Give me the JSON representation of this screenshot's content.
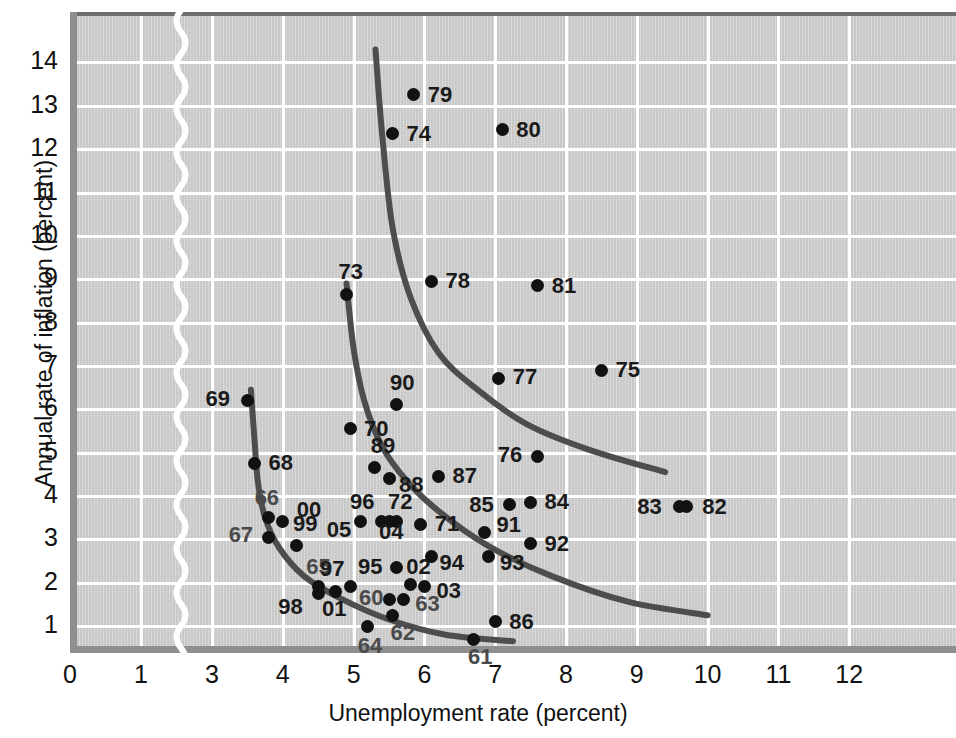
{
  "axes": {
    "x_title": "Unemployment rate (percent)",
    "y_title": "Annual rate of inflation (percent)",
    "x_ticks": [
      "0",
      "1",
      "3",
      "4",
      "5",
      "6",
      "7",
      "8",
      "9",
      "10",
      "11",
      "12"
    ],
    "y_ticks": [
      "14",
      "13",
      "12",
      "11",
      "10",
      "9",
      "8",
      "7",
      "6",
      "5",
      "4",
      "3",
      "2",
      "1"
    ],
    "has_axis_break": "true",
    "grid_color": "#ffffff",
    "panel_color": "#c9c9c9",
    "point_color": "#111111",
    "curve_color": "#4d4d4d"
  },
  "chart_data": {
    "type": "scatter",
    "title": "",
    "xlabel": "Unemployment rate (percent)",
    "ylabel": "Annual rate of inflation (percent)",
    "xlim": [
      0,
      12.5
    ],
    "ylim": [
      0,
      14.6
    ],
    "grid": true,
    "legend": "none",
    "axis_break": {
      "between": [
        1,
        3
      ],
      "axis": "x"
    },
    "point_label_format": "two-digit year",
    "points": [
      {
        "label": "60",
        "x": 5.5,
        "y": 1.6
      },
      {
        "label": "61",
        "x": 6.7,
        "y": 0.7
      },
      {
        "label": "62",
        "x": 5.55,
        "y": 1.25
      },
      {
        "label": "63",
        "x": 5.7,
        "y": 1.6
      },
      {
        "label": "64",
        "x": 5.2,
        "y": 1.0
      },
      {
        "label": "65",
        "x": 4.5,
        "y": 1.9
      },
      {
        "label": "66",
        "x": 3.8,
        "y": 3.5
      },
      {
        "label": "67",
        "x": 3.8,
        "y": 3.05
      },
      {
        "label": "68",
        "x": 3.6,
        "y": 4.75
      },
      {
        "label": "69",
        "x": 3.5,
        "y": 6.2
      },
      {
        "label": "70",
        "x": 4.95,
        "y": 5.55
      },
      {
        "label": "71",
        "x": 5.95,
        "y": 3.35
      },
      {
        "label": "72",
        "x": 5.6,
        "y": 3.4
      },
      {
        "label": "73",
        "x": 4.9,
        "y": 8.65
      },
      {
        "label": "74",
        "x": 5.55,
        "y": 12.35
      },
      {
        "label": "75",
        "x": 8.5,
        "y": 6.9
      },
      {
        "label": "76",
        "x": 7.6,
        "y": 4.9
      },
      {
        "label": "77",
        "x": 7.05,
        "y": 6.7
      },
      {
        "label": "78",
        "x": 6.1,
        "y": 8.95
      },
      {
        "label": "79",
        "x": 5.85,
        "y": 13.25
      },
      {
        "label": "80",
        "x": 7.1,
        "y": 12.45
      },
      {
        "label": "81",
        "x": 7.6,
        "y": 8.85
      },
      {
        "label": "82",
        "x": 9.7,
        "y": 3.75
      },
      {
        "label": "83",
        "x": 9.6,
        "y": 3.75
      },
      {
        "label": "84",
        "x": 7.5,
        "y": 3.85
      },
      {
        "label": "85",
        "x": 7.2,
        "y": 3.8
      },
      {
        "label": "86",
        "x": 7.0,
        "y": 1.1
      },
      {
        "label": "87",
        "x": 6.2,
        "y": 4.45
      },
      {
        "label": "88",
        "x": 5.5,
        "y": 4.4
      },
      {
        "label": "89",
        "x": 5.3,
        "y": 4.65
      },
      {
        "label": "90",
        "x": 5.6,
        "y": 6.1
      },
      {
        "label": "91",
        "x": 6.85,
        "y": 3.15
      },
      {
        "label": "92",
        "x": 7.5,
        "y": 2.9
      },
      {
        "label": "93",
        "x": 6.9,
        "y": 2.6
      },
      {
        "label": "94",
        "x": 6.1,
        "y": 2.6
      },
      {
        "label": "95",
        "x": 5.6,
        "y": 2.35
      },
      {
        "label": "96",
        "x": 5.4,
        "y": 3.4
      },
      {
        "label": "97",
        "x": 4.95,
        "y": 1.9
      },
      {
        "label": "98",
        "x": 4.5,
        "y": 1.75
      },
      {
        "label": "99",
        "x": 4.2,
        "y": 2.85
      },
      {
        "label": "00",
        "x": 4.0,
        "y": 3.4
      },
      {
        "label": "01",
        "x": 4.75,
        "y": 1.8
      },
      {
        "label": "02",
        "x": 5.8,
        "y": 1.95
      },
      {
        "label": "03",
        "x": 6.0,
        "y": 1.9
      },
      {
        "label": "04",
        "x": 5.5,
        "y": 3.4
      },
      {
        "label": "05",
        "x": 5.1,
        "y": 3.4
      }
    ],
    "curves": [
      {
        "name": "short-run-phillips-curve-1970s",
        "description": "upper shifted short-run Phillips curve",
        "points": [
          [
            5.31,
            14.3
          ],
          [
            5.4,
            12.4
          ],
          [
            5.55,
            10.2
          ],
          [
            5.8,
            8.6
          ],
          [
            6.2,
            7.3
          ],
          [
            6.75,
            6.45
          ],
          [
            7.45,
            5.65
          ],
          [
            8.35,
            5.05
          ],
          [
            9.4,
            4.55
          ]
        ]
      },
      {
        "name": "short-run-phillips-curve-1960s-70s-mid",
        "description": "middle short-run Phillips curve",
        "points": [
          [
            4.9,
            8.9
          ],
          [
            5.0,
            7.4
          ],
          [
            5.15,
            6.2
          ],
          [
            5.4,
            5.15
          ],
          [
            5.75,
            4.35
          ],
          [
            6.2,
            3.65
          ],
          [
            6.9,
            2.85
          ],
          [
            7.8,
            2.15
          ],
          [
            8.9,
            1.55
          ],
          [
            10.0,
            1.25
          ]
        ]
      },
      {
        "name": "short-run-phillips-curve-1960s",
        "description": "lower original short-run Phillips curve",
        "points": [
          [
            3.55,
            6.45
          ],
          [
            3.6,
            5.3
          ],
          [
            3.65,
            4.3
          ],
          [
            3.75,
            3.5
          ],
          [
            3.95,
            2.8
          ],
          [
            4.3,
            2.15
          ],
          [
            4.8,
            1.65
          ],
          [
            5.5,
            1.15
          ],
          [
            6.3,
            0.8
          ],
          [
            7.25,
            0.65
          ]
        ]
      }
    ]
  }
}
